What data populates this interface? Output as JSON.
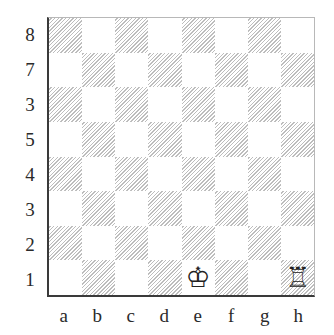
{
  "diagram": {
    "type": "chess-board",
    "rank_labels": [
      "8",
      "7",
      "3",
      "5",
      "4",
      "3",
      "2",
      "1"
    ],
    "file_labels": [
      "a",
      "b",
      "c",
      "d",
      "e",
      "f",
      "g",
      "h"
    ],
    "colors": {
      "light_square": "#ffffff",
      "dark_square_hatch": "#bdbdbd",
      "border_dark": "#3a3a3a",
      "border_light": "#b8b8b8",
      "label_text": "#2a2a2a"
    },
    "pieces": [
      {
        "square": "e1",
        "piece": "white-king",
        "glyph": "♔"
      },
      {
        "square": "h1",
        "piece": "white-rook",
        "glyph": "♖"
      }
    ]
  }
}
